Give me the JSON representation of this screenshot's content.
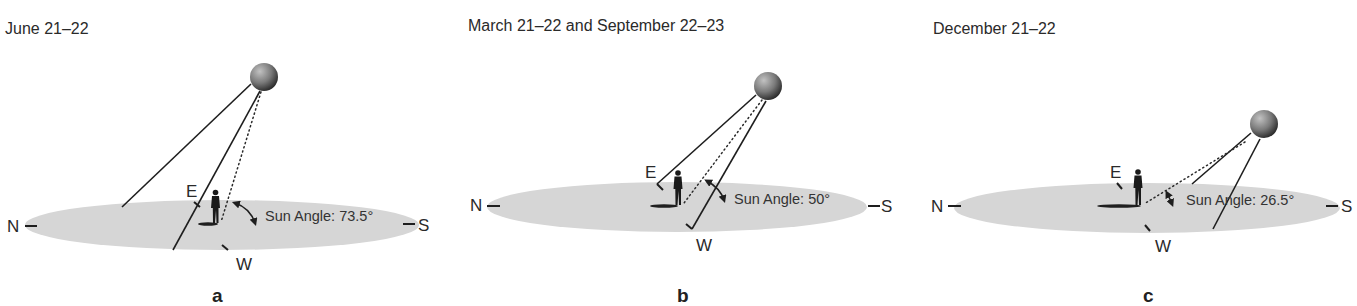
{
  "figure": {
    "type": "diagram",
    "colors": {
      "ground": "#d6d6d6",
      "sun_light": "#b8b8b8",
      "sun_dark": "#2e2e2e",
      "line": "#1e1e1e",
      "text": "#2a2a2a"
    },
    "panels": [
      {
        "id": "a",
        "title": "June 21–22",
        "label": "a",
        "sun_angle_label": "Sun Angle: 73.5°",
        "sun_angle_deg": 73.5,
        "compass": {
          "north": "N",
          "south": "S",
          "east": "E",
          "west": "W"
        }
      },
      {
        "id": "b",
        "title": "March 21–22 and September 22–23",
        "label": "b",
        "sun_angle_label": "Sun Angle: 50°",
        "sun_angle_deg": 50,
        "compass": {
          "north": "N",
          "south": "S",
          "east": "E",
          "west": "W"
        }
      },
      {
        "id": "c",
        "title": "December 21–22",
        "label": "c",
        "sun_angle_label": "Sun Angle: 26.5°",
        "sun_angle_deg": 26.5,
        "compass": {
          "north": "N",
          "south": "S",
          "east": "E",
          "west": "W"
        }
      }
    ]
  }
}
